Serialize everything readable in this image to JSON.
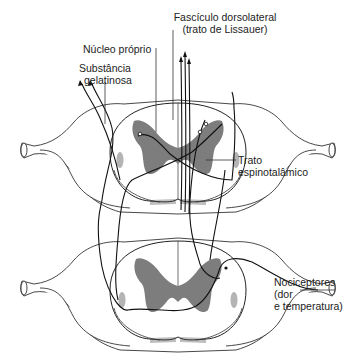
{
  "figure": {
    "labels": {
      "fasciculo_line1": "Fascículo dorsolateral",
      "fasciculo_line2": "(trato de Lissauer)",
      "nucleo_proprio": "Núcleo próprio",
      "substancia_line1": "Substância",
      "substancia_line2": "gelatinosa",
      "trato_line1": "Trato",
      "trato_line2": "espinotalâmico",
      "nociceptores_line1": "Nociceptores",
      "nociceptores_line2": "(dor",
      "nociceptores_line3": "e temperatura)"
    },
    "sections": [
      {
        "name": "upper-spinal-cord-section",
        "center_y": 150
      },
      {
        "name": "lower-spinal-cord-section",
        "center_y": 278
      }
    ],
    "colors": {
      "gray_matter": "#7d7d7d",
      "tract": "#b4b4b4",
      "line": "#111111"
    }
  }
}
